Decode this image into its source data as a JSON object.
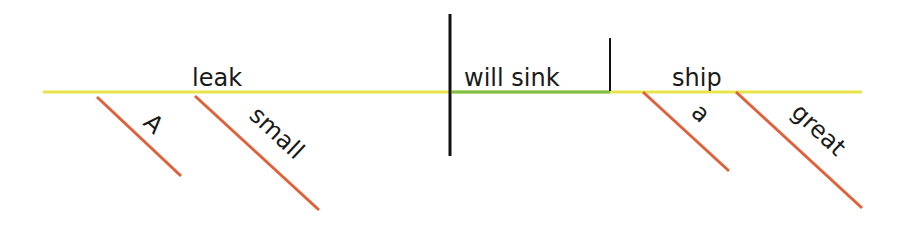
{
  "diagram": {
    "type": "sentence-diagram",
    "sentence": "A small leak will sink a great ship",
    "colors": {
      "baseline": "#e8e44a",
      "verb_underline": "#7cc04a",
      "modifier": "#e0603a",
      "divider": "#111111"
    },
    "subject": {
      "word": "leak",
      "modifiers": [
        "A",
        "small"
      ]
    },
    "verb": {
      "word": "will sink"
    },
    "object": {
      "word": "ship",
      "modifiers": [
        "a",
        "great"
      ]
    }
  }
}
